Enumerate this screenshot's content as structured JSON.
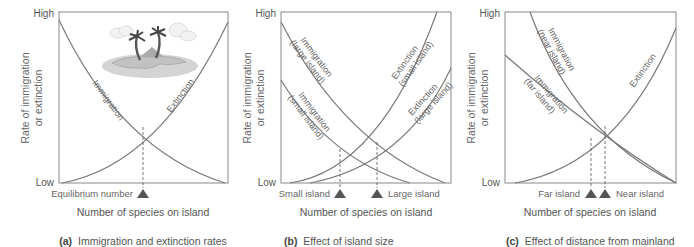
{
  "figure": {
    "y_tick_high": "High",
    "y_tick_low": "Low",
    "y_label_line1": "Rate of immigration",
    "y_label_line2": "or extinction",
    "x_label": "Number of species on island",
    "colors": {
      "curve": "#7a7a7a",
      "axis": "#888888",
      "marker": "#555555",
      "text": "#555555"
    }
  },
  "panels": [
    {
      "id": "a",
      "caption_letter": "(a)",
      "caption_text": "Immigration and extinction rates",
      "curves": [
        {
          "label": "Immigration"
        },
        {
          "label": "Extinction"
        }
      ],
      "markers": [
        {
          "label": "Equilibrium number"
        }
      ],
      "illustration": "island-with-palm-trees"
    },
    {
      "id": "b",
      "caption_letter": "(b)",
      "caption_text": "Effect of island size",
      "curves": [
        {
          "label": "Immigration",
          "sublabel": "(large island)"
        },
        {
          "label": "Immigration",
          "sublabel": "(small island)"
        },
        {
          "label": "Extinction",
          "sublabel": "(small island)"
        },
        {
          "label": "Extinction",
          "sublabel": "(large island)"
        }
      ],
      "markers": [
        {
          "label": "Small island"
        },
        {
          "label": "Large island"
        }
      ]
    },
    {
      "id": "c",
      "caption_letter": "(c)",
      "caption_text": "Effect of distance from mainland",
      "curves": [
        {
          "label": "Immigration",
          "sublabel": "(near island)"
        },
        {
          "label": "Immigration",
          "sublabel": "(far island)"
        },
        {
          "label": "Extinction"
        }
      ],
      "markers": [
        {
          "label": "Far island"
        },
        {
          "label": "Near island"
        }
      ]
    }
  ]
}
